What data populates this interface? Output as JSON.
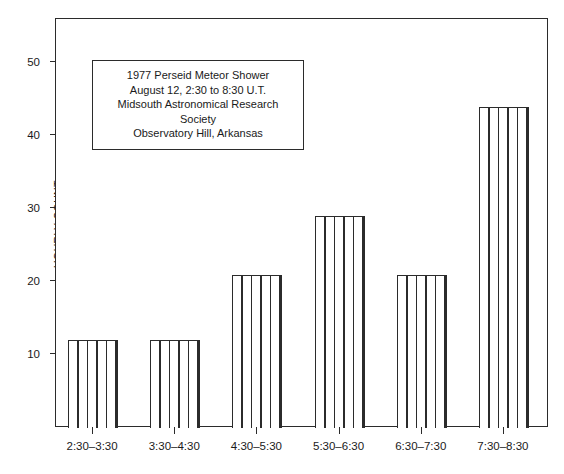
{
  "chart_data": {
    "type": "bar",
    "title": "1977 Perseid Meteor Shower",
    "xlabel": "",
    "ylabel": "HOURLY COUNT",
    "categories": [
      "2:30–3:30",
      "3:30–4:30",
      "4:30–5:30",
      "5:30–6:30",
      "6:30–7:30",
      "7:30–8:30"
    ],
    "values": [
      12,
      12,
      21,
      29,
      21,
      44
    ],
    "ylim": [
      0,
      56
    ],
    "ytick_labels": [
      "10",
      "20",
      "30",
      "40",
      "50"
    ],
    "ytick_values": [
      10,
      20,
      30,
      40,
      50
    ],
    "grid": false,
    "legend": false,
    "bar_fill": "vertical-hatch",
    "bar_color": "#2b2b2b",
    "background": "#ffffff"
  },
  "caption": {
    "lines": [
      "1977 Perseid Meteor Shower",
      "August 12, 2:30 to 8:30 U.T.",
      "Midsouth Astronomical Research",
      "Society",
      "Observatory Hill, Arkansas"
    ]
  },
  "axes": {
    "y_title": "HOURLY COUNT"
  }
}
